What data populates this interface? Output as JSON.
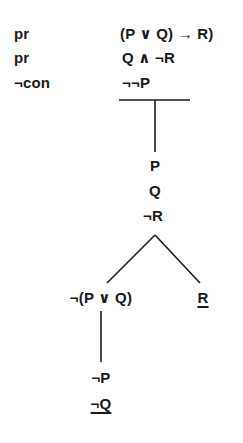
{
  "tree": {
    "premises": [
      {
        "label": "pr",
        "formula": "(P ∨ Q) → R)"
      },
      {
        "label": "pr",
        "formula": "Q ∧ ¬R"
      },
      {
        "label": "¬con",
        "formula": "¬¬P"
      }
    ],
    "trunk_nodes": [
      "P",
      "Q",
      "¬R"
    ],
    "branches": {
      "left": {
        "head": "¬(P ∨ Q)",
        "nodes": [
          "¬P",
          "¬Q"
        ],
        "closed": true,
        "closing_node": "¬Q"
      },
      "right": {
        "head": "R",
        "nodes": [],
        "closed": true,
        "closing_node": "R"
      }
    },
    "line_color": "#1a1a1a"
  }
}
